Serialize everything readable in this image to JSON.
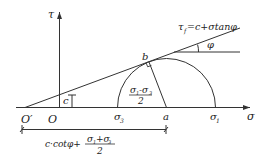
{
  "diagram": {
    "colors": {
      "line": "#333333",
      "text": "#222222",
      "background": "#ffffff"
    },
    "axes": {
      "tau_label": "τ",
      "sigma_label": "σ"
    },
    "envelope": {
      "label_main": "τ",
      "label_sub": "f",
      "label_rest": "=c+σtanφ",
      "angle_label": "φ"
    },
    "points": {
      "o_prime": "O′",
      "origin": "O",
      "sigma3_main": "σ",
      "sigma3_sub": "3",
      "a": "a",
      "sigma1_main": "σ",
      "sigma1_sub": "1",
      "b": "b"
    },
    "cohesion_label": "c",
    "radius_label": {
      "num_1": "σ",
      "num_1_sub": "1",
      "num_op": "-σ",
      "num_2_sub": "3",
      "den": "2"
    },
    "dimension_label": {
      "prefix": "c·cotφ+",
      "num_1": "σ",
      "num_1_sub": "1",
      "num_op": "+σ",
      "num_2_sub": "3",
      "den": "2"
    }
  }
}
